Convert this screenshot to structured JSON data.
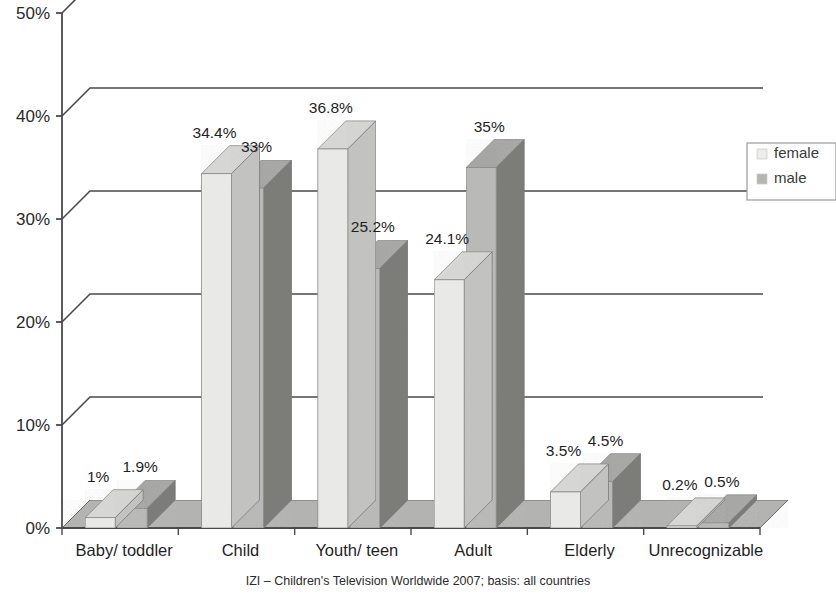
{
  "chart_data": {
    "type": "bar",
    "title": "",
    "subtitle": "",
    "xlabel": "",
    "ylabel": "",
    "categories": [
      "Baby/ toddler",
      "Child",
      "Youth/ teen",
      "Adult",
      "Elderly",
      "Unrecognizable"
    ],
    "series": [
      {
        "name": "female",
        "values": [
          1,
          34.4,
          36.8,
          24.1,
          3.5,
          0.2
        ],
        "labels": [
          "1%",
          "34.4%",
          "36.8%",
          "24.1%",
          "3.5%",
          "0.2%"
        ],
        "color": "#e9e9e7"
      },
      {
        "name": "male",
        "values": [
          1.9,
          33,
          25.2,
          35,
          4.5,
          0.5
        ],
        "labels": [
          "1.9%",
          "33%",
          "25.2%",
          "35%",
          "4.5%",
          "0.5%"
        ],
        "color": "#b9b9b7"
      }
    ],
    "ylim": [
      0,
      50
    ],
    "yticks": [
      0,
      10,
      20,
      30,
      40,
      50
    ],
    "ytick_labels": [
      "0%",
      "10%",
      "20%",
      "30%",
      "40%",
      "50%"
    ],
    "grid": true,
    "legend_position": "right",
    "three_d": true,
    "caption": "IZI – Children's Television Worldwide 2007; basis: all countries"
  },
  "legend": {
    "items": [
      {
        "label": "female",
        "color": "#ececea"
      },
      {
        "label": "male",
        "color": "#b5b5b3"
      }
    ]
  },
  "axis": {
    "y_ticks": [
      "50%",
      "40%",
      "30%",
      "20%",
      "10%",
      "0%"
    ],
    "x_ticks": [
      "Baby/ toddler",
      "Child",
      "Youth/ teen",
      "Adult",
      "Elderly",
      "Unrecognizable"
    ]
  },
  "footer": {
    "caption": "IZI – Children's Television Worldwide 2007; basis: all countries"
  },
  "colors": {
    "female_front": "#e9e9e7",
    "female_top": "#d6d6d4",
    "female_side": "#c2c2c0",
    "male_front": "#b9b9b7",
    "male_top": "#a6a6a4",
    "male_side": "#7b7b79",
    "floor": "#b3b3b1",
    "axis_line": "#4a4a4a",
    "grid_line": "#4a4a4a"
  }
}
